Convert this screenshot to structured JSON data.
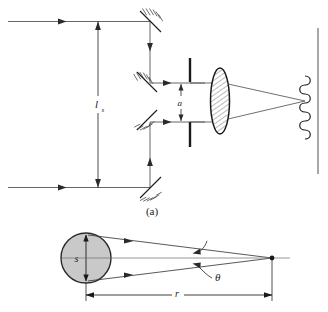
{
  "figure": {
    "title_caption_a": "(a)",
    "domain": "optics-diagram"
  },
  "panel_a": {
    "caption": "(a)",
    "labels": {
      "separation": "l",
      "separation_sub": "s",
      "aperture": "a"
    },
    "elements": {
      "incoming_ray_top": "incoming-ray-top",
      "incoming_ray_bottom": "incoming-ray-bottom",
      "mirror_top": "mirror-top-45",
      "mirror_mid_upper": "mirror-mid-upper-45",
      "mirror_mid_lower": "mirror-mid-lower-45",
      "mirror_bottom": "mirror-bottom-45",
      "aperture_bar_upper": "aperture-bar-upper",
      "aperture_bar_lower": "aperture-bar-lower",
      "lens": "converging-lens",
      "screen": "observation-screen",
      "fringes": "interference-fringe-pattern",
      "dimension_ls": "dimension-line-ls",
      "dimension_a": "dimension-line-a"
    },
    "colors": {
      "stroke": "#1a1a1a",
      "ray": "#4a4a4a",
      "screen": "#6e6e6e",
      "lens_fill": "#ffffff",
      "background": "#ffffff"
    }
  },
  "panel_b": {
    "labels": {
      "source_size": "s",
      "angle": "θ",
      "distance": "r"
    },
    "elements": {
      "source_disk": "source-disk",
      "source_diameter_arrow": "source-diameter-arrow",
      "upper_ray": "upper-ray",
      "lower_ray": "lower-ray",
      "axis_ray": "axis-ray",
      "convergence_point": "convergence-point",
      "angle_leader": "angle-leader-line",
      "ray_leader": "ray-leader-line",
      "dimension_r": "dimension-line-r"
    },
    "colors": {
      "disk_fill": "#c9c9c9",
      "disk_stroke": "#2a2a2a",
      "ray": "#3a3a3a",
      "dimension": "#1a1a1a"
    }
  }
}
